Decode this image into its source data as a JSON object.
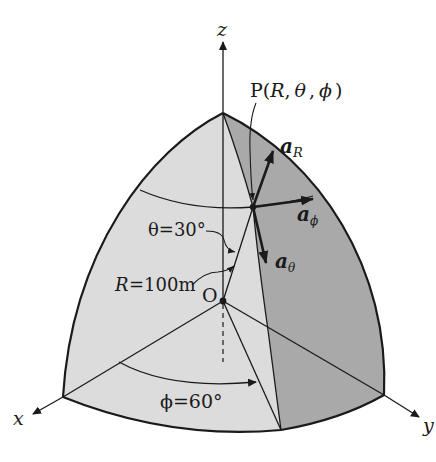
{
  "figure": {
    "type": "spherical-coordinates-octant",
    "colors": {
      "background": "#ffffff",
      "light_face": "#dcdcdc",
      "dark_face": "#a9a9a9",
      "stroke": "#1a1a1a"
    }
  },
  "axes": {
    "z_label": "z",
    "x_label": "x",
    "y_label": "y"
  },
  "point": {
    "label_prefix": "P(",
    "R": "R",
    "comma1": ",",
    "theta": "θ",
    "comma2": ",",
    "phi": "ϕ",
    "label_suffix": ")"
  },
  "origin": {
    "label": "O"
  },
  "unit_vectors": {
    "aR": {
      "base": "a",
      "sub": "R"
    },
    "aphi": {
      "base": "a",
      "sub": "ϕ"
    },
    "atheta": {
      "base": "a",
      "sub": "θ"
    }
  },
  "annotations": {
    "theta": "θ=30°",
    "R": "R=100m",
    "phi": "ϕ=60°"
  }
}
